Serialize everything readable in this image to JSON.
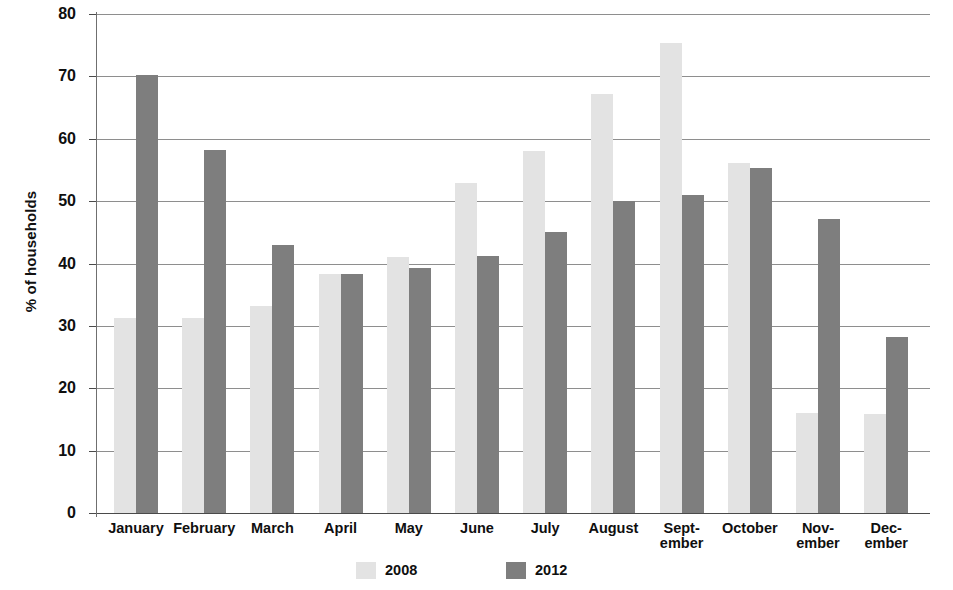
{
  "chart_data": {
    "type": "bar",
    "title": "",
    "xlabel": "",
    "ylabel": "% of households",
    "ylim": [
      0,
      80
    ],
    "yticks": [
      0,
      10,
      20,
      30,
      40,
      50,
      60,
      70,
      80
    ],
    "ytick_labels": [
      "0",
      "10",
      "20",
      "30",
      "40",
      "50",
      "60",
      "70",
      "80"
    ],
    "grid": true,
    "legend_position": "bottom",
    "categories": [
      "January",
      "February",
      "March",
      "April",
      "May",
      "June",
      "July",
      "August",
      "September",
      "October",
      "November",
      "December"
    ],
    "category_label_lines": [
      [
        "January"
      ],
      [
        "February"
      ],
      [
        "March"
      ],
      [
        "April"
      ],
      [
        "May"
      ],
      [
        "June"
      ],
      [
        "July"
      ],
      [
        "August"
      ],
      [
        "Sept-",
        "ember"
      ],
      [
        "October"
      ],
      [
        "Nov-",
        "ember"
      ],
      [
        "Dec-",
        "ember"
      ]
    ],
    "series": [
      {
        "name": "2008",
        "color": "#e3e3e3",
        "values": [
          31.3,
          31.3,
          33.2,
          38.3,
          41.1,
          52.9,
          58.0,
          67.2,
          75.3,
          56.1,
          16.0,
          15.8
        ]
      },
      {
        "name": "2012",
        "color": "#7e7e7e",
        "values": [
          70.3,
          58.2,
          43.0,
          38.3,
          39.3,
          41.2,
          45.0,
          50.0,
          51.0,
          55.3,
          47.2,
          28.2
        ]
      }
    ]
  },
  "legend": {
    "entries": [
      {
        "label": "2008"
      },
      {
        "label": "2012"
      }
    ]
  }
}
